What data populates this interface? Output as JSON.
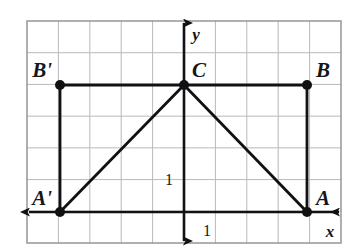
{
  "figure": {
    "background_color": "#ffffff"
  },
  "grid": {
    "line_color": "#b9b9bd",
    "border_color": "#8e8e94",
    "columns": 10,
    "rows": 7,
    "cell_width_px": 31.4,
    "cell_height_px": 31.7,
    "left_px": 27,
    "top_px": 21,
    "right_px": 341,
    "bottom_px": 243
  },
  "axes": {
    "stroke_color": "#111114",
    "x_axis": {
      "label": "x",
      "label_x": 330,
      "label_y": 237,
      "y_px": 212,
      "x_start_px": 29,
      "x_end_px": 339
    },
    "y_axis": {
      "label": "y",
      "label_x": 196,
      "label_y": 40,
      "x_px": 184,
      "y_start_px": 23,
      "y_end_px": 241
    },
    "ticks": [
      {
        "name": "unit-y",
        "value": "1",
        "x": 173,
        "y": 185,
        "anchor": "end"
      },
      {
        "name": "unit-x",
        "value": "1",
        "x": 207,
        "y": 236,
        "anchor": "middle"
      }
    ]
  },
  "points": [
    {
      "id": "C",
      "label": "C",
      "x": 184,
      "y": 85,
      "label_x": 192,
      "label_y": 77,
      "label_anchor": "start"
    },
    {
      "id": "B",
      "label": "B",
      "x": 307,
      "y": 85,
      "label_x": 316,
      "label_y": 77,
      "label_anchor": "start"
    },
    {
      "id": "Bp",
      "label": "B'",
      "x": 60,
      "y": 85,
      "label_x": 52,
      "label_y": 77,
      "label_anchor": "end"
    },
    {
      "id": "A",
      "label": "A",
      "x": 307,
      "y": 212,
      "label_x": 316,
      "label_y": 205,
      "label_anchor": "start"
    },
    {
      "id": "Ap",
      "label": "A'",
      "x": 60,
      "y": 212,
      "label_x": 52,
      "label_y": 205,
      "label_anchor": "end"
    }
  ],
  "segments": [
    {
      "name": "segment-bprime-c",
      "x1": 60,
      "y1": 85,
      "x2": 184,
      "y2": 85
    },
    {
      "name": "segment-c-b",
      "x1": 184,
      "y1": 85,
      "x2": 307,
      "y2": 85
    },
    {
      "name": "segment-bprime-aprime",
      "x1": 60,
      "y1": 85,
      "x2": 60,
      "y2": 212
    },
    {
      "name": "segment-b-a",
      "x1": 307,
      "y1": 85,
      "x2": 307,
      "y2": 212
    },
    {
      "name": "segment-aprime-c",
      "x1": 60,
      "y1": 212,
      "x2": 184,
      "y2": 85
    },
    {
      "name": "segment-c-a",
      "x1": 184,
      "y1": 85,
      "x2": 307,
      "y2": 212
    }
  ],
  "chart_data": {
    "type": "scatter",
    "xlabel": "x",
    "ylabel": "y",
    "grid": true,
    "legend": "none",
    "unit_tick_x": 1,
    "unit_tick_y": 1,
    "xlim": [
      -5,
      5
    ],
    "ylim": [
      -1,
      6
    ],
    "points": [
      {
        "label": "C",
        "x": 0,
        "y": 4
      },
      {
        "label": "B",
        "x": 4,
        "y": 4
      },
      {
        "label": "B'",
        "x": -4,
        "y": 4
      },
      {
        "label": "A",
        "x": 4,
        "y": 0
      },
      {
        "label": "A'",
        "x": -4,
        "y": 0
      }
    ],
    "edges": [
      [
        "B'",
        "C"
      ],
      [
        "C",
        "B"
      ],
      [
        "B'",
        "A'"
      ],
      [
        "B",
        "A"
      ],
      [
        "A'",
        "C"
      ],
      [
        "C",
        "A"
      ]
    ]
  }
}
